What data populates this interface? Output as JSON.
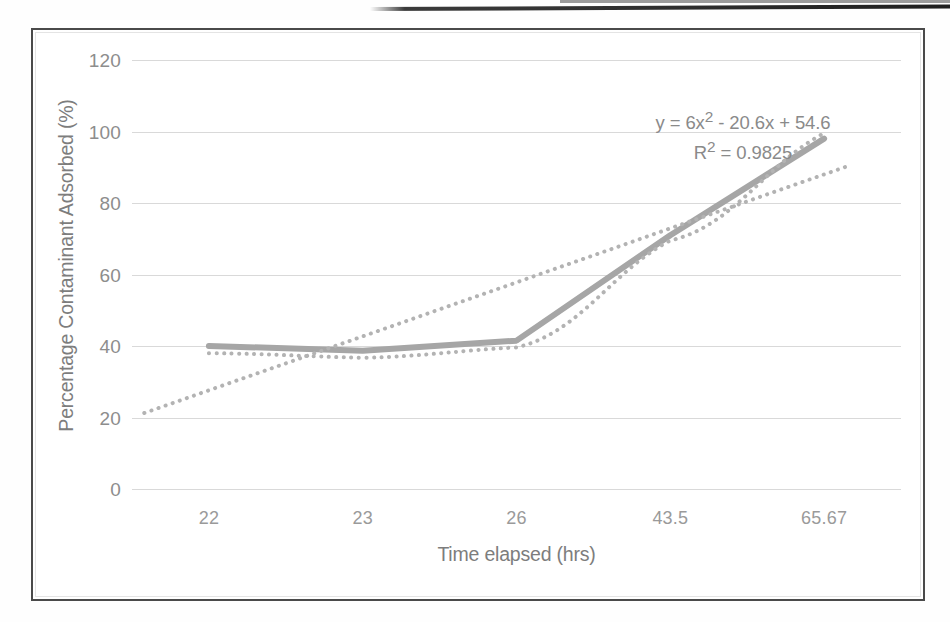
{
  "page": {
    "kind": "scanned-figure",
    "background_color": "#fefefe"
  },
  "figure": {
    "border_color": "#4a4a4a",
    "plot_background": "#ffffff"
  },
  "chart_data": {
    "type": "line",
    "title": "",
    "subtitle": "",
    "xlabel": "Time elapsed (hrs)",
    "ylabel": "Percentage Contaminant Adsorbed (%)",
    "categories": [
      "22",
      "23",
      "26",
      "43.5",
      "65.67"
    ],
    "x_numeric": [
      22,
      23,
      26,
      43.5,
      65.67
    ],
    "series": [
      {
        "name": "Percentage Contaminant Adsorbed",
        "style": "solid",
        "color": "#a6a6a6",
        "line_width": 6,
        "values": [
          40.0,
          38.7,
          41.5,
          71.0,
          98.0
        ]
      },
      {
        "name": "Polynomial trendline (order 2)",
        "style": "dotted",
        "color": "#b3b3b3",
        "line_width": 4,
        "values": [
          38.0,
          36.7,
          39.6,
          69.5,
          99.5
        ]
      },
      {
        "name": "Linear trendline",
        "style": "dotted",
        "color": "#b3b3b3",
        "line_width": 4,
        "values": [
          27.6,
          42.0,
          57.0,
          73.0,
          88.0
        ]
      }
    ],
    "ylim": [
      0,
      120
    ],
    "y_ticks": [
      "0",
      "20",
      "40",
      "60",
      "80",
      "100",
      "120"
    ],
    "y_tick_values": [
      0,
      20,
      40,
      60,
      80,
      100,
      120
    ],
    "grid": "horizontal",
    "grid_color": "#aaaaaa",
    "legend": "none",
    "annotations": [
      {
        "id": "trend-equation",
        "text": "y = 6x² - 20.6x + 54.6"
      },
      {
        "id": "trend-r-squared",
        "text": "R² = 0.9825"
      }
    ],
    "equation": {
      "line1_prefix": "y = 6x",
      "line1_sup": "2",
      "line1_suffix": " - 20.6x + 54.6",
      "line2_prefix": "R",
      "line2_sup": "2",
      "line2_suffix": " = 0.9825"
    }
  },
  "axis": {
    "y_title": "Percentage Contaminant Adsorbed (%)",
    "x_title": "Time elapsed (hrs)"
  }
}
